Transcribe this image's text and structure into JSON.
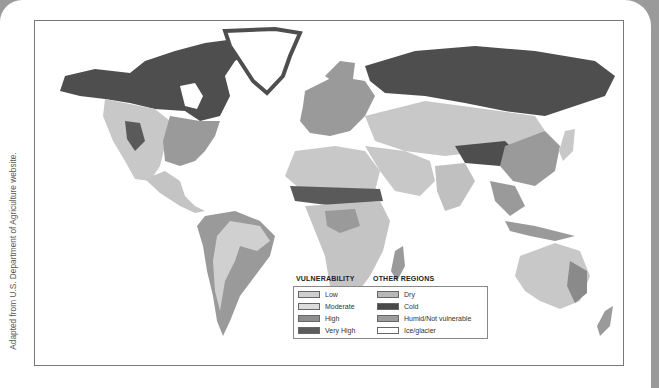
{
  "source_note": "Adapted from U.S. Department of Agriculture website.",
  "legend": {
    "vulnerability": {
      "title": "VULNERABILITY",
      "items": [
        {
          "label": "Low",
          "color": "#cfcfcf"
        },
        {
          "label": "Moderate",
          "color": "#dcdcdc"
        },
        {
          "label": "High",
          "color": "#8e8e8e"
        },
        {
          "label": "Very High",
          "color": "#5c5c5c"
        }
      ]
    },
    "other_regions": {
      "title": "OTHER REGIONS",
      "items": [
        {
          "label": "Dry",
          "color": "#b8b8b8"
        },
        {
          "label": "Cold",
          "color": "#4a4a4a"
        },
        {
          "label": "Humid/Not vulnerable",
          "color": "#9c9c9c"
        },
        {
          "label": "Ice/glacier",
          "color": "#ffffff"
        }
      ]
    }
  },
  "map": {
    "subject": "World map of desertification vulnerability",
    "colors": {
      "cold": "#4e4e4e",
      "humid": "#9a9a9a",
      "dry": "#c4c4c4",
      "low": "#d4d4d4",
      "high": "#8a8a8a",
      "very_high": "#5a5a5a",
      "ice": "#ffffff"
    }
  }
}
